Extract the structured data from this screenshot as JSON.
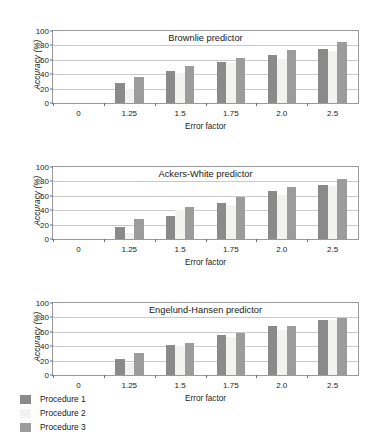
{
  "figure": {
    "background": "#ffffff",
    "series_colors": {
      "procedure_1": "#8a8a8a",
      "procedure_2": "#f2f2f0",
      "procedure_3": "#9c9c9c"
    }
  },
  "legend": {
    "position": "bottom-left",
    "items": [
      {
        "label": "Procedure 1",
        "color": "#8a8a8a"
      },
      {
        "label": "Procedure 2",
        "color": "#f2f2f0"
      },
      {
        "label": "Procedure 3",
        "color": "#9c9c9c"
      }
    ]
  },
  "chart_data": [
    {
      "type": "bar",
      "title": "Brownlie predictor",
      "xlabel": "Error factor",
      "ylabel": "Accuracy (%)",
      "categories": [
        "1.25",
        "1.5",
        "1.75",
        "2.0",
        "2.5"
      ],
      "xtick_labels": [
        "0",
        "1.25",
        "1.5",
        "1.75",
        "2.0",
        "2.5"
      ],
      "ytick_labels": [
        "0",
        "20",
        "40",
        "60",
        "80",
        "100"
      ],
      "ylim": [
        0,
        100
      ],
      "yticks": [
        0,
        20,
        40,
        60,
        80,
        100
      ],
      "grid": true,
      "legend": "shared-bottom",
      "series": [
        {
          "name": "Procedure 1",
          "values": [
            28,
            45,
            57,
            66,
            75
          ]
        },
        {
          "name": "Procedure 2",
          "values": [
            20,
            41,
            56,
            61,
            72
          ]
        },
        {
          "name": "Procedure 3",
          "values": [
            36,
            52,
            62,
            73,
            85
          ]
        }
      ]
    },
    {
      "type": "bar",
      "title": "Ackers-White predictor",
      "xlabel": "Error factor",
      "ylabel": "Accuracy (%)",
      "categories": [
        "1.25",
        "1.5",
        "1.75",
        "2.0",
        "2.5"
      ],
      "xtick_labels": [
        "0",
        "1.25",
        "1.5",
        "1.75",
        "2.0",
        "2.5"
      ],
      "ytick_labels": [
        "0",
        "20",
        "40",
        "60",
        "80",
        "100"
      ],
      "ylim": [
        0,
        100
      ],
      "yticks": [
        0,
        20,
        40,
        60,
        80,
        100
      ],
      "grid": true,
      "legend": "shared-bottom",
      "series": [
        {
          "name": "Procedure 1",
          "values": [
            17,
            32,
            50,
            66,
            75
          ]
        },
        {
          "name": "Procedure 2",
          "values": [
            9,
            40,
            47,
            61,
            73
          ]
        },
        {
          "name": "Procedure 3",
          "values": [
            28,
            44,
            59,
            72,
            84
          ]
        }
      ]
    },
    {
      "type": "bar",
      "title": "Engelund-Hansen predictor",
      "xlabel": "Error factor",
      "ylabel": "Accuracy (%)",
      "categories": [
        "1.25",
        "1.5",
        "1.75",
        "2.0",
        "2.5"
      ],
      "xtick_labels": [
        "0",
        "1.25",
        "1.5",
        "1.75",
        "2.0",
        "2.5"
      ],
      "ytick_labels": [
        "0",
        "20",
        "40",
        "60",
        "80",
        "100"
      ],
      "ylim": [
        0,
        100
      ],
      "yticks": [
        0,
        20,
        40,
        60,
        80,
        100
      ],
      "grid": true,
      "legend": "shared-bottom",
      "series": [
        {
          "name": "Procedure 1",
          "values": [
            22,
            42,
            56,
            68,
            77
          ]
        },
        {
          "name": "Procedure 2",
          "values": [
            16,
            40,
            53,
            62,
            76
          ]
        },
        {
          "name": "Procedure 3",
          "values": [
            30,
            45,
            58,
            68,
            79
          ]
        }
      ]
    }
  ]
}
